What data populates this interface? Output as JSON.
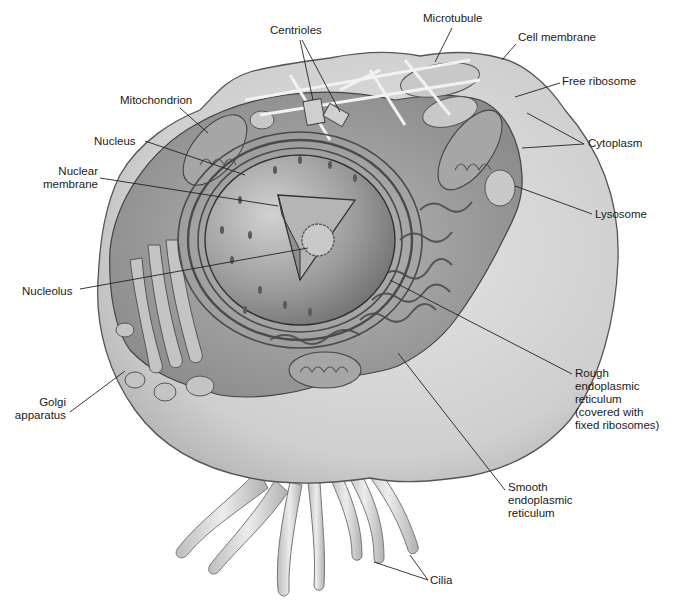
{
  "diagram": {
    "labels": [
      {
        "id": "centrioles",
        "lines": [
          "Centrioles"
        ],
        "x": 270,
        "y": 24,
        "align": "l"
      },
      {
        "id": "microtubule",
        "lines": [
          "Microtubule"
        ],
        "x": 423,
        "y": 12,
        "align": "l"
      },
      {
        "id": "cell-membrane",
        "lines": [
          "Cell membrane"
        ],
        "x": 518,
        "y": 31,
        "align": "l"
      },
      {
        "id": "mitochondrion",
        "lines": [
          "Mitochondrion"
        ],
        "x": 120,
        "y": 94,
        "align": "l"
      },
      {
        "id": "free-ribosome",
        "lines": [
          "Free ribosome"
        ],
        "x": 562,
        "y": 75,
        "align": "l"
      },
      {
        "id": "nucleus",
        "lines": [
          "Nucleus"
        ],
        "x": 94,
        "y": 135,
        "align": "l"
      },
      {
        "id": "cytoplasm",
        "lines": [
          "Cytoplasm"
        ],
        "x": 588,
        "y": 137,
        "align": "l"
      },
      {
        "id": "nuclear-membrane",
        "lines": [
          "Nuclear",
          "membrane"
        ],
        "x": 40,
        "y": 165,
        "align": "r",
        "w": 58
      },
      {
        "id": "lysosome",
        "lines": [
          "Lysosome"
        ],
        "x": 595,
        "y": 208,
        "align": "l"
      },
      {
        "id": "nucleolus",
        "lines": [
          "Nucleolus"
        ],
        "x": 22,
        "y": 285,
        "align": "l"
      },
      {
        "id": "rough-er",
        "lines": [
          "Rough",
          "endoplasmic",
          "reticulum",
          "(covered with",
          "fixed ribosomes)"
        ],
        "x": 575,
        "y": 367,
        "align": "l"
      },
      {
        "id": "golgi",
        "lines": [
          "Golgi",
          "apparatus"
        ],
        "x": 12,
        "y": 396,
        "align": "r",
        "w": 54
      },
      {
        "id": "smooth-er",
        "lines": [
          "Smooth",
          "endoplasmic",
          "reticulum"
        ],
        "x": 508,
        "y": 481,
        "align": "l"
      },
      {
        "id": "cilia",
        "lines": [
          "Cilia"
        ],
        "x": 430,
        "y": 574,
        "align": "l"
      }
    ],
    "leaders": [
      {
        "id": "centrioles-a",
        "x1": 300,
        "y1": 40,
        "x2": 313,
        "y2": 100
      },
      {
        "id": "centrioles-b",
        "x1": 302,
        "y1": 40,
        "x2": 340,
        "y2": 112
      },
      {
        "id": "microtubule",
        "x1": 452,
        "y1": 28,
        "x2": 435,
        "y2": 62
      },
      {
        "id": "cell-membrane",
        "x1": 516,
        "y1": 44,
        "x2": 502,
        "y2": 60
      },
      {
        "id": "mitochondrion",
        "x1": 180,
        "y1": 108,
        "x2": 208,
        "y2": 133
      },
      {
        "id": "free-ribosome",
        "x1": 560,
        "y1": 83,
        "x2": 515,
        "y2": 97
      },
      {
        "id": "nucleus",
        "x1": 145,
        "y1": 141,
        "x2": 245,
        "y2": 175
      },
      {
        "id": "cytoplasm-a",
        "x1": 584,
        "y1": 144,
        "x2": 527,
        "y2": 113
      },
      {
        "id": "cytoplasm-b",
        "x1": 584,
        "y1": 144,
        "x2": 522,
        "y2": 148
      },
      {
        "id": "nuclear-membrane",
        "x1": 100,
        "y1": 178,
        "x2": 278,
        "y2": 206
      },
      {
        "id": "lysosome",
        "x1": 592,
        "y1": 214,
        "x2": 515,
        "y2": 186
      },
      {
        "id": "nucleolus",
        "x1": 80,
        "y1": 289,
        "x2": 308,
        "y2": 248
      },
      {
        "id": "rough-er",
        "x1": 572,
        "y1": 374,
        "x2": 390,
        "y2": 280
      },
      {
        "id": "golgi",
        "x1": 70,
        "y1": 412,
        "x2": 125,
        "y2": 371
      },
      {
        "id": "smooth-er",
        "x1": 505,
        "y1": 490,
        "x2": 398,
        "y2": 353
      },
      {
        "id": "cilia-a",
        "x1": 428,
        "y1": 580,
        "x2": 374,
        "y2": 562
      },
      {
        "id": "cilia-b",
        "x1": 428,
        "y1": 580,
        "x2": 410,
        "y2": 555
      }
    ]
  },
  "colors": {
    "background": "#ffffff",
    "cell_outer": "#d6d6d6",
    "cell_cut": "#9a9a9a",
    "nucleus": "#8c8c8c",
    "leader": "#222222",
    "text": "#1a1a1a"
  }
}
